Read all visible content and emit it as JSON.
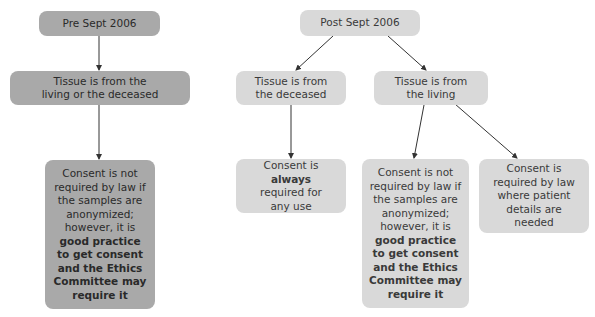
{
  "pre": {
    "title": "Pre Sept 2006",
    "tissue": "Tissue is from the living or the deceased",
    "consent_pre": "Consent is not required by law if the samples are anonymized; however, it is",
    "consent_bold": "good practice to get consent and the Ethics Committee may require it"
  },
  "post": {
    "title": "Post Sept 2006",
    "deceased": "Tissue is from the deceased",
    "living": "Tissue is from the living",
    "deceased_consent_a": "Consent is",
    "deceased_consent_bold": "always",
    "deceased_consent_b": "required for any use",
    "living_consent_pre": "Consent is not required by law if the samples are anonymized; however, it is",
    "living_consent_bold": "good practice to get consent and the Ethics Committee may require it",
    "patient_details": "Consent is required by law where patient details are needed"
  },
  "colors": {
    "pre_box": "#a9a9a9",
    "post_box": "#d9d9d9",
    "arrow": "#333333"
  }
}
